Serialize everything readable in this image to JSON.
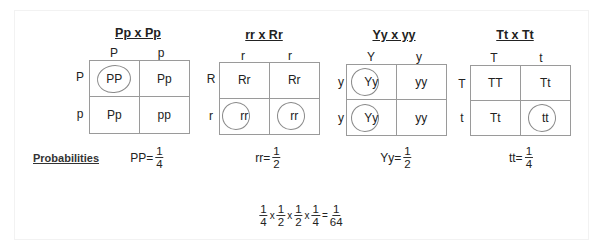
{
  "squares": [
    {
      "title": "Pp x Pp",
      "cols": [
        "P",
        "p"
      ],
      "rows": [
        "P",
        "p"
      ],
      "cells": [
        {
          "text": "PP",
          "circled": true
        },
        {
          "text": "Pp",
          "circled": false
        },
        {
          "text": "Pp",
          "circled": false
        },
        {
          "text": "pp",
          "circled": false
        }
      ]
    },
    {
      "title": "rr x Rr",
      "cols": [
        "r",
        "r"
      ],
      "rows": [
        "R",
        "r"
      ],
      "cells": [
        {
          "text": "Rr",
          "circled": false
        },
        {
          "text": "Rr",
          "circled": false
        },
        {
          "text": "rr",
          "circled": true
        },
        {
          "text": "rr",
          "circled": true
        }
      ]
    },
    {
      "title": "Yy x yy",
      "cols": [
        "Y",
        "y"
      ],
      "rows": [
        "y",
        "y"
      ],
      "cells": [
        {
          "text": "Yy",
          "circled": true
        },
        {
          "text": "yy",
          "circled": false
        },
        {
          "text": "Yy",
          "circled": true
        },
        {
          "text": "yy",
          "circled": false
        }
      ]
    },
    {
      "title": "Tt x Tt",
      "cols": [
        "T",
        "t"
      ],
      "rows": [
        "T",
        "t"
      ],
      "cells": [
        {
          "text": "TT",
          "circled": false
        },
        {
          "text": "Tt",
          "circled": false
        },
        {
          "text": "Tt",
          "circled": false
        },
        {
          "text": "tt",
          "circled": true
        }
      ]
    }
  ],
  "probabilities": {
    "heading": "Probabilities",
    "items": [
      {
        "label": "PP=",
        "num": "1",
        "den": "4"
      },
      {
        "label": "rr=",
        "num": "1",
        "den": "2"
      },
      {
        "label": "Yy=",
        "num": "1",
        "den": "2"
      },
      {
        "label": "tt=",
        "num": "1",
        "den": "4"
      }
    ]
  },
  "equation": {
    "factors": [
      {
        "num": "1",
        "den": "4"
      },
      {
        "num": "1",
        "den": "2"
      },
      {
        "num": "1",
        "den": "2"
      },
      {
        "num": "1",
        "den": "4"
      }
    ],
    "times": "x",
    "equals": "=",
    "result": {
      "num": "1",
      "den": "64"
    }
  }
}
